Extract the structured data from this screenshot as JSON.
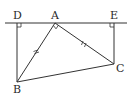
{
  "figure": {
    "type": "geometry",
    "line_color": "#333333",
    "points": {
      "D": {
        "label": "D",
        "x": 17,
        "y": 23
      },
      "A": {
        "label": "A",
        "x": 55,
        "y": 23
      },
      "E": {
        "label": "E",
        "x": 114,
        "y": 23
      },
      "B": {
        "label": "B",
        "x": 17,
        "y": 82
      },
      "C": {
        "label": "C",
        "x": 114,
        "y": 64
      }
    },
    "segments": [
      "DE",
      "DB",
      "EC",
      "AB",
      "AC",
      "BC"
    ],
    "right_angles": [
      "D",
      "E",
      "A"
    ],
    "equal_marks": [
      "AB",
      "AC"
    ]
  }
}
